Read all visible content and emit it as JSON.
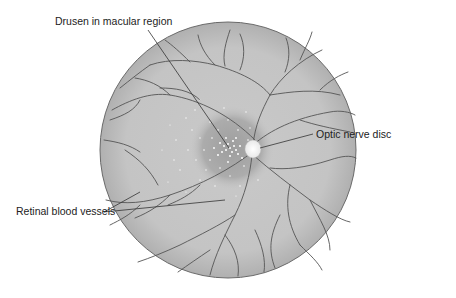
{
  "diagram": {
    "labels": {
      "drusen": "Drusen in macular region",
      "optic_disc": "Optic nerve disc",
      "vessels": "Retinal blood vessels"
    },
    "colors": {
      "fundus_fill": "#c8c8c8",
      "fundus_edge": "#6a6a6a",
      "macula": "#a9a9a9",
      "vessel": "#555555",
      "drusen": "#ffffff",
      "leader_line": "#333333"
    }
  }
}
